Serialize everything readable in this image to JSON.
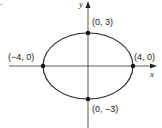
{
  "figure": {
    "type": "ellipse-graph",
    "marker": ".",
    "axes": {
      "x_label": "x",
      "y_label": "y"
    },
    "points": [
      {
        "label": "(0, 3)",
        "x": 0,
        "y": 3
      },
      {
        "label": "(-4, 0)",
        "display": "(−4, 0)",
        "x": -4,
        "y": 0
      },
      {
        "label": "(4, 0)",
        "x": 4,
        "y": 0
      },
      {
        "label": "(0, -3)",
        "display": "(0, −3)",
        "x": 0,
        "y": -3
      }
    ],
    "ellipse": {
      "center": [
        0,
        0
      ],
      "semi_major_x": 4,
      "semi_minor_y": 3
    },
    "colors": {
      "stroke": "#222222",
      "background": "#ffffff"
    }
  },
  "labels": {
    "marker": ".",
    "x_axis": "x",
    "y_axis": "y",
    "top": "(0, 3)",
    "left": "(−4, 0)",
    "right": "(4, 0)",
    "bottom": "(0, −3)"
  }
}
